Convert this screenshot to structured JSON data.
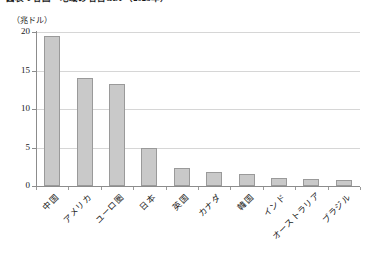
{
  "chart_data": {
    "type": "bar",
    "title": "図表 1 各国・地域の名目GDP（2023年）",
    "unit_label": "（兆ドル）",
    "xlabel": "",
    "ylabel": "",
    "ylim": [
      0,
      20
    ],
    "yticks": [
      0,
      5,
      10,
      15,
      20
    ],
    "ytick_labels": [
      "0",
      "5",
      "10",
      "15",
      "20"
    ],
    "grid": true,
    "legend": "none",
    "categories": [
      "中国",
      "アメリカ",
      "ユーロ圏",
      "日本",
      "英国",
      "カナダ",
      "韓国",
      "インド",
      "オーストラリア",
      "ブラジル"
    ],
    "values": [
      19.5,
      14.0,
      13.3,
      4.9,
      2.3,
      1.8,
      1.5,
      1.1,
      0.9,
      0.8
    ],
    "bar_color": "#c9c9c9",
    "bar_border_color": "#9a9a9a",
    "gridline_color": "#d6d6d6",
    "axis_color": "#8c8c8c"
  }
}
